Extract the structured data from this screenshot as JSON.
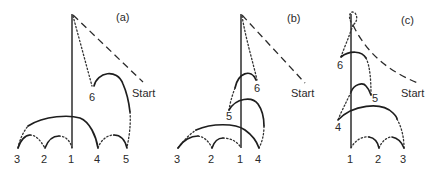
{
  "figure": {
    "panels": [
      {
        "id": "a",
        "label": "(a)",
        "start_label": "Start",
        "points": [
          "3",
          "2",
          "1",
          "4",
          "5",
          "6"
        ],
        "bottom_sequence": [
          "3",
          "2",
          "1",
          "4",
          "5"
        ]
      },
      {
        "id": "b",
        "label": "(b)",
        "start_label": "Start",
        "points": [
          "3",
          "2",
          "1",
          "4",
          "5",
          "6"
        ],
        "bottom_sequence": [
          "3",
          "2",
          "1",
          "4"
        ]
      },
      {
        "id": "c",
        "label": "(c)",
        "start_label": "Start",
        "points": [
          "1",
          "2",
          "3",
          "4",
          "5",
          "6"
        ],
        "bottom_sequence": [
          "1",
          "2",
          "3"
        ]
      }
    ],
    "legend": {
      "solid": "arc / jump",
      "dotted": "connecting path",
      "dashed": "start approach"
    }
  }
}
